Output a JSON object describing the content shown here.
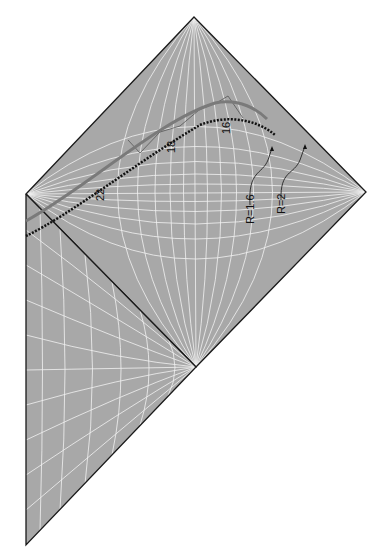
{
  "diagram": {
    "type": "Penrose conformal diagram",
    "colors": {
      "region_fill": "#a9a9a9",
      "grid": "#ffffff",
      "border": "#1a1a1a",
      "curve_outer": "#7a7a7a",
      "curve_inner": "#111111"
    },
    "worldline_labels": [
      "22",
      "18",
      "16"
    ],
    "radius_labels": [
      "R=1.6",
      "R=2"
    ]
  }
}
